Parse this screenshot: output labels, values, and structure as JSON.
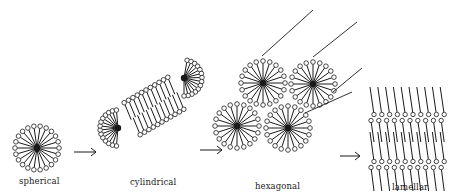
{
  "labels": {
    "spherical": "spherical",
    "cylindrical": "cylindrical",
    "hexagonal": "hexagonal",
    "lamellar": "lamellar"
  },
  "colors": {
    "ink": "#1a1a1a",
    "background": "#ffffff"
  },
  "micelles": [
    {
      "id": "spherical",
      "cx": 37,
      "cy": 148,
      "r": 22,
      "n": 22
    },
    {
      "id": "cyl-end-left",
      "cx": 118,
      "cy": 128,
      "r": 18,
      "n": 14,
      "start": 95,
      "end": 265
    },
    {
      "id": "cyl-end-right",
      "cx": 184,
      "cy": 78,
      "r": 18,
      "n": 14,
      "start": -80,
      "end": 90
    },
    {
      "id": "hex-1",
      "cx": 263,
      "cy": 83,
      "r": 22,
      "n": 20
    },
    {
      "id": "hex-2",
      "cx": 313,
      "cy": 84,
      "r": 22,
      "n": 20
    },
    {
      "id": "hex-3",
      "cx": 237,
      "cy": 126,
      "r": 22,
      "n": 20
    },
    {
      "id": "hex-4",
      "cx": 288,
      "cy": 128,
      "r": 22,
      "n": 20
    }
  ],
  "cylinder_body": {
    "x1": 130,
    "y1": 120,
    "x2": 178,
    "y2": 92,
    "count": 11
  },
  "hex_rods": [
    [
      262,
      56,
      313,
      10
    ],
    [
      313,
      57,
      357,
      22
    ],
    [
      333,
      92,
      362,
      68
    ],
    [
      305,
      113,
      352,
      92
    ]
  ],
  "arrows": [
    [
      74,
      152,
      96,
      152
    ],
    [
      200,
      150,
      222,
      150
    ],
    [
      340,
      156,
      360,
      156
    ]
  ],
  "lamellar": {
    "x0": 372,
    "cols": 10,
    "dx": 7.8,
    "bilayers": [
      {
        "top": 105,
        "bottom": 130
      },
      {
        "top": 150,
        "bottom": 179
      }
    ]
  }
}
